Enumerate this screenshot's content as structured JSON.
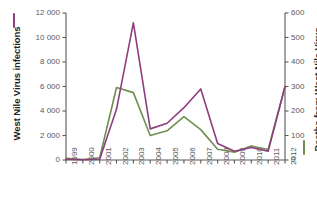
{
  "chart_data": {
    "type": "line",
    "title": "",
    "xlabel": "",
    "categories": [
      "1999",
      "2000",
      "2001",
      "2002",
      "2003",
      "2004",
      "2005",
      "2006",
      "2007",
      "2008",
      "2009",
      "2010",
      "2011",
      "2012"
    ],
    "grid": false,
    "legend_position": "axis-titles",
    "axes": {
      "left": {
        "label": "West Nile Virus infections",
        "ticks": [
          "0",
          "2 000",
          "4 000",
          "6 000",
          "8 000",
          "10 000",
          "12 000"
        ],
        "tick_values": [
          0,
          2000,
          4000,
          6000,
          8000,
          10000,
          12000
        ],
        "ylim": [
          0,
          12000
        ],
        "color": "#8e3d7f"
      },
      "right": {
        "label": "Deaths from West Nile Virus",
        "ticks": [
          "0",
          "100",
          "200",
          "300",
          "400",
          "500",
          "600"
        ],
        "tick_values": [
          0,
          100,
          200,
          300,
          400,
          500,
          600
        ],
        "ylim": [
          0,
          600
        ],
        "color": "#6f8f4e"
      }
    },
    "series": [
      {
        "name": "West Nile Virus infections",
        "axis": "left",
        "color": "#8e3d7f",
        "values": [
          60,
          20,
          65,
          4160,
          11200,
          2540,
          3000,
          4270,
          5800,
          1350,
          720,
          1020,
          710,
          6000
        ]
      },
      {
        "name": "Deaths from West Nile Virus",
        "axis": "right",
        "color": "#6f8f4e",
        "values": [
          7,
          2,
          9,
          296,
          275,
          100,
          119,
          177,
          124,
          44,
          32,
          57,
          43,
          299
        ]
      }
    ]
  },
  "colors": {
    "purple": "#8e3d7f",
    "green": "#6f8f4e",
    "axis": "#58595b",
    "title_text": "#231f20",
    "background": "#ffffff"
  }
}
